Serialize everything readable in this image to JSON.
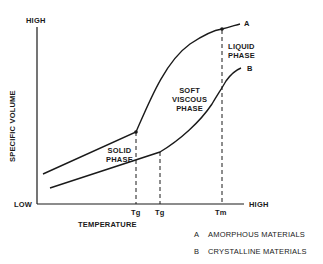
{
  "diagram": {
    "y_axis": {
      "label": "SPECIFIC VOLUME",
      "high": "HIGH",
      "low": "LOW"
    },
    "x_axis": {
      "label": "TEMPERATURE",
      "high": "HIGH"
    },
    "ticks": [
      {
        "label": "Tg"
      },
      {
        "label": "Tg"
      },
      {
        "label": "Tm"
      }
    ],
    "regions": {
      "solid": [
        "SOLID",
        "PHASE"
      ],
      "soft_viscous": [
        "SOFT",
        "VISCOUS",
        "PHASE"
      ],
      "liquid": [
        "LIQUID",
        "PHASE"
      ]
    },
    "curves": [
      {
        "key": "A",
        "name": "AMORPHOUS MATERIALS"
      },
      {
        "key": "B",
        "name": "CRYSTALLINE MATERIALS"
      }
    ],
    "colors": {
      "line": "#1a1a1a",
      "background": "#ffffff"
    }
  }
}
